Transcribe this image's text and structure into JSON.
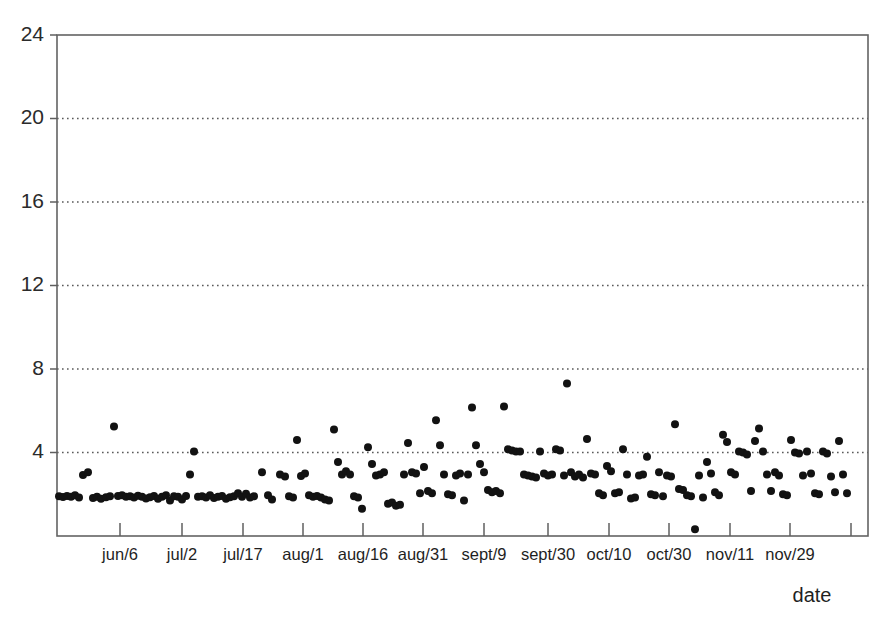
{
  "chart_data": {
    "type": "scatter",
    "title": "",
    "subtitle": "",
    "xlabel": "date",
    "ylabel": "",
    "grid": true,
    "legend": null,
    "ylim": [
      0,
      24
    ],
    "yticks": [
      4,
      8,
      12,
      16,
      20,
      24
    ],
    "ytick_labels": [
      "4",
      "8",
      "12",
      "16",
      "20",
      "24"
    ],
    "xtick_labels": [
      "jun/6",
      "jul/2",
      "jul/17",
      "aug/1",
      "aug/16",
      "aug/31",
      "sept/9",
      "sept/30",
      "oct/10",
      "oct/30",
      "nov/11",
      "nov/29"
    ],
    "xtick_positions": [
      120,
      182,
      243,
      303,
      363,
      423,
      484,
      548,
      609,
      669,
      730,
      790
    ],
    "extra_tick_positions": [
      851
    ],
    "marker": "filled-circle",
    "marker_color": "#121212",
    "marker_size_px": 8,
    "series": [
      {
        "name": "observations",
        "points": [
          [
            59,
            1.9
          ],
          [
            63,
            1.87
          ],
          [
            67,
            1.92
          ],
          [
            71,
            1.88
          ],
          [
            75,
            1.95
          ],
          [
            79,
            1.85
          ],
          [
            83,
            2.92
          ],
          [
            88,
            3.05
          ],
          [
            93,
            1.82
          ],
          [
            97,
            1.88
          ],
          [
            101,
            1.78
          ],
          [
            106,
            1.86
          ],
          [
            110,
            1.9
          ],
          [
            114,
            5.25
          ],
          [
            118,
            1.92
          ],
          [
            122,
            1.95
          ],
          [
            126,
            1.88
          ],
          [
            130,
            1.9
          ],
          [
            134,
            1.85
          ],
          [
            138,
            1.93
          ],
          [
            142,
            1.88
          ],
          [
            146,
            1.8
          ],
          [
            150,
            1.86
          ],
          [
            154,
            1.92
          ],
          [
            158,
            1.78
          ],
          [
            162,
            1.88
          ],
          [
            166,
            1.95
          ],
          [
            170,
            1.7
          ],
          [
            174,
            1.9
          ],
          [
            178,
            1.88
          ],
          [
            182,
            1.75
          ],
          [
            186,
            1.92
          ],
          [
            190,
            2.95
          ],
          [
            194,
            4.05
          ],
          [
            198,
            1.88
          ],
          [
            202,
            1.9
          ],
          [
            206,
            1.85
          ],
          [
            210,
            1.95
          ],
          [
            214,
            1.82
          ],
          [
            218,
            1.88
          ],
          [
            222,
            1.92
          ],
          [
            226,
            1.78
          ],
          [
            230,
            1.86
          ],
          [
            234,
            1.9
          ],
          [
            238,
            2.05
          ],
          [
            242,
            1.88
          ],
          [
            246,
            2.02
          ],
          [
            250,
            1.85
          ],
          [
            254,
            1.9
          ],
          [
            262,
            3.05
          ],
          [
            268,
            1.95
          ],
          [
            272,
            1.75
          ],
          [
            280,
            2.95
          ],
          [
            285,
            2.85
          ],
          [
            289,
            1.9
          ],
          [
            293,
            1.85
          ],
          [
            297,
            4.6
          ],
          [
            301,
            2.88
          ],
          [
            305,
            3.0
          ],
          [
            309,
            1.95
          ],
          [
            313,
            1.88
          ],
          [
            317,
            1.92
          ],
          [
            321,
            1.85
          ],
          [
            325,
            1.75
          ],
          [
            329,
            1.7
          ],
          [
            334,
            5.1
          ],
          [
            338,
            3.55
          ],
          [
            342,
            2.95
          ],
          [
            346,
            3.1
          ],
          [
            350,
            2.95
          ],
          [
            354,
            1.9
          ],
          [
            358,
            1.85
          ],
          [
            362,
            1.3
          ],
          [
            368,
            4.25
          ],
          [
            372,
            3.45
          ],
          [
            376,
            2.9
          ],
          [
            380,
            2.95
          ],
          [
            384,
            3.05
          ],
          [
            388,
            1.55
          ],
          [
            392,
            1.6
          ],
          [
            396,
            1.45
          ],
          [
            400,
            1.5
          ],
          [
            404,
            2.95
          ],
          [
            408,
            4.45
          ],
          [
            412,
            3.05
          ],
          [
            416,
            3.0
          ],
          [
            420,
            2.05
          ],
          [
            424,
            3.3
          ],
          [
            428,
            2.15
          ],
          [
            432,
            2.05
          ],
          [
            436,
            5.55
          ],
          [
            440,
            4.35
          ],
          [
            444,
            2.95
          ],
          [
            448,
            2.0
          ],
          [
            452,
            1.95
          ],
          [
            456,
            2.9
          ],
          [
            460,
            3.0
          ],
          [
            464,
            1.7
          ],
          [
            468,
            2.95
          ],
          [
            472,
            6.15
          ],
          [
            476,
            4.35
          ],
          [
            480,
            3.45
          ],
          [
            484,
            3.05
          ],
          [
            488,
            2.2
          ],
          [
            492,
            2.1
          ],
          [
            496,
            2.15
          ],
          [
            500,
            2.05
          ],
          [
            504,
            6.2
          ],
          [
            508,
            4.15
          ],
          [
            512,
            4.1
          ],
          [
            516,
            4.05
          ],
          [
            520,
            4.05
          ],
          [
            524,
            2.95
          ],
          [
            528,
            2.9
          ],
          [
            532,
            2.85
          ],
          [
            536,
            2.8
          ],
          [
            540,
            4.05
          ],
          [
            544,
            3.0
          ],
          [
            548,
            2.9
          ],
          [
            552,
            2.95
          ],
          [
            556,
            4.15
          ],
          [
            560,
            4.1
          ],
          [
            564,
            2.9
          ],
          [
            567,
            7.3
          ],
          [
            571,
            3.05
          ],
          [
            575,
            2.85
          ],
          [
            579,
            2.95
          ],
          [
            583,
            2.8
          ],
          [
            587,
            4.65
          ],
          [
            591,
            3.0
          ],
          [
            595,
            2.95
          ],
          [
            599,
            2.05
          ],
          [
            603,
            1.95
          ],
          [
            607,
            3.35
          ],
          [
            611,
            3.1
          ],
          [
            615,
            2.05
          ],
          [
            619,
            2.1
          ],
          [
            623,
            4.15
          ],
          [
            627,
            2.95
          ],
          [
            631,
            1.8
          ],
          [
            635,
            1.85
          ],
          [
            639,
            2.9
          ],
          [
            643,
            2.95
          ],
          [
            647,
            3.8
          ],
          [
            651,
            2.0
          ],
          [
            655,
            1.95
          ],
          [
            659,
            3.05
          ],
          [
            663,
            1.9
          ],
          [
            667,
            2.9
          ],
          [
            671,
            2.85
          ],
          [
            675,
            5.35
          ],
          [
            679,
            2.25
          ],
          [
            683,
            2.2
          ],
          [
            687,
            1.95
          ],
          [
            691,
            1.9
          ],
          [
            695,
            0.32
          ],
          [
            699,
            2.9
          ],
          [
            703,
            1.85
          ],
          [
            707,
            3.55
          ],
          [
            711,
            3.0
          ],
          [
            715,
            2.1
          ],
          [
            719,
            1.95
          ],
          [
            723,
            4.85
          ],
          [
            727,
            4.5
          ],
          [
            731,
            3.05
          ],
          [
            735,
            2.95
          ],
          [
            739,
            4.05
          ],
          [
            743,
            4.0
          ],
          [
            747,
            3.9
          ],
          [
            751,
            2.15
          ],
          [
            755,
            4.55
          ],
          [
            759,
            5.15
          ],
          [
            763,
            4.05
          ],
          [
            767,
            2.95
          ],
          [
            771,
            2.15
          ],
          [
            775,
            3.05
          ],
          [
            779,
            2.9
          ],
          [
            783,
            2.0
          ],
          [
            787,
            1.95
          ],
          [
            791,
            4.6
          ],
          [
            795,
            4.0
          ],
          [
            799,
            3.95
          ],
          [
            803,
            2.9
          ],
          [
            807,
            4.05
          ],
          [
            811,
            3.0
          ],
          [
            815,
            2.05
          ],
          [
            819,
            2.0
          ],
          [
            823,
            4.05
          ],
          [
            827,
            3.95
          ],
          [
            831,
            2.85
          ],
          [
            835,
            2.1
          ],
          [
            839,
            4.55
          ],
          [
            843,
            2.95
          ],
          [
            847,
            2.05
          ]
        ]
      }
    ]
  },
  "axes": {
    "plot_left": 57,
    "plot_right": 868,
    "plot_top": 35,
    "plot_bottom": 536,
    "y_value_at_top": 24,
    "y_value_at_bottom": 0
  }
}
